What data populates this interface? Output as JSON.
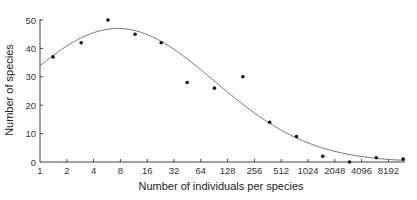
{
  "chart_data": {
    "type": "scatter",
    "title": "",
    "xlabel": "Number of individuals per species",
    "ylabel": "Number of species",
    "x_scale": "log2",
    "xlim": [
      1,
      11000
    ],
    "ylim": [
      0,
      50
    ],
    "x_ticks": [
      1,
      2,
      4,
      8,
      16,
      32,
      64,
      128,
      256,
      512,
      1024,
      2048,
      4096,
      8192
    ],
    "x_tick_labels": [
      "1",
      "2",
      "4",
      "8",
      "16",
      "32",
      "64",
      "128",
      "256",
      "512",
      "1024",
      "2048",
      "4096",
      "8192"
    ],
    "y_ticks": [
      0,
      10,
      20,
      30,
      40,
      50
    ],
    "y_tick_labels": [
      "0",
      "10",
      "20",
      "30",
      "40",
      "50"
    ],
    "grid": false,
    "series": [
      {
        "name": "observed",
        "kind": "points",
        "x": [
          1.4,
          2.9,
          5.8,
          11.7,
          23,
          45,
          91,
          190,
          380,
          760,
          1500,
          3000,
          6000,
          12000
        ],
        "y": [
          37,
          42,
          50,
          45,
          42,
          28,
          26,
          30,
          14,
          9,
          2,
          0,
          1.5,
          1
        ]
      },
      {
        "name": "fitted lognormal",
        "kind": "curve",
        "peak_x": 7.5,
        "peak_y": 47,
        "sigma_octaves": 3.6
      }
    ]
  }
}
